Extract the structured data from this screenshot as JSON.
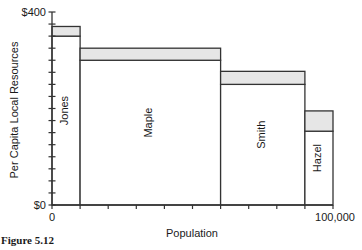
{
  "chart_data": {
    "type": "bar",
    "subtype": "variable-width stacked bar",
    "title": "",
    "xlabel": "Population",
    "ylabel": "Per Capita Local Resources",
    "xlim": [
      0,
      100000
    ],
    "ylim": [
      0,
      400
    ],
    "x_tick_labels": [
      "0",
      "100,000"
    ],
    "y_tick_labels": [
      "$0",
      "$400"
    ],
    "x_tick_step": 10000,
    "y_tick_step": 25,
    "grid": false,
    "legend": null,
    "categories": [
      "Jones",
      "Maple",
      "Smith",
      "Hazel"
    ],
    "population_ranges": [
      [
        0,
        10000
      ],
      [
        10000,
        60000
      ],
      [
        60000,
        90000
      ],
      [
        90000,
        100000
      ]
    ],
    "series": [
      {
        "name": "base",
        "color": "#ffffff",
        "values": [
          350,
          300,
          250,
          153
        ]
      },
      {
        "name": "shaded increment",
        "color": "#e6e6e6",
        "values": [
          20,
          25,
          27,
          42
        ]
      }
    ],
    "totals": [
      370,
      325,
      277,
      195
    ]
  },
  "labels": {
    "ylabel": "Per Capita Local Resources",
    "xlabel": "Population",
    "y_top": "$400",
    "y_bottom": "$0",
    "x_left": "0",
    "x_right": "100,000",
    "bars": [
      "Jones",
      "Maple",
      "Smith",
      "Hazel"
    ]
  },
  "caption": "Figure 5.12"
}
